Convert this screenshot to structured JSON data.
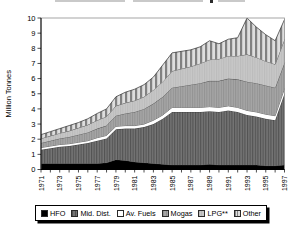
{
  "chart_data": {
    "type": "area",
    "stacked": true,
    "title": "",
    "ylabel": "Million Tonnes",
    "ylim": [
      0,
      10
    ],
    "yticks": [
      0,
      1,
      2,
      3,
      4,
      5,
      6,
      7,
      8,
      9,
      10
    ],
    "x": [
      1971,
      1972,
      1973,
      1974,
      1975,
      1976,
      1977,
      1978,
      1979,
      1980,
      1981,
      1982,
      1983,
      1984,
      1985,
      1986,
      1987,
      1988,
      1989,
      1990,
      1991,
      1992,
      1993,
      1994,
      1995,
      1996,
      1997
    ],
    "xtick_labels": [
      "1971",
      "1973",
      "1975",
      "1977",
      "1979",
      "1981",
      "1983",
      "1985",
      "1987",
      "1989",
      "1991",
      "1993",
      "1995",
      "1997"
    ],
    "grid": false,
    "legend_position": "bottom",
    "series": [
      {
        "name": "HFO",
        "color": "#000000",
        "pattern": "solid",
        "values": [
          0.4,
          0.4,
          0.4,
          0.4,
          0.4,
          0.4,
          0.4,
          0.45,
          0.65,
          0.6,
          0.5,
          0.45,
          0.4,
          0.35,
          0.3,
          0.3,
          0.3,
          0.3,
          0.35,
          0.3,
          0.3,
          0.3,
          0.3,
          0.3,
          0.25,
          0.25,
          0.3
        ]
      },
      {
        "name": "Mid. Dist.",
        "color": "#757575",
        "pattern": "vstripes-dark",
        "values": [
          0.9,
          1.0,
          1.1,
          1.15,
          1.25,
          1.35,
          1.5,
          1.6,
          2.0,
          2.1,
          2.2,
          2.35,
          2.6,
          3.0,
          3.5,
          3.5,
          3.5,
          3.5,
          3.5,
          3.5,
          3.6,
          3.5,
          3.3,
          3.2,
          3.1,
          3.0,
          4.7
        ]
      },
      {
        "name": "Av. Fuels",
        "color": "#ffffff",
        "pattern": "solid",
        "values": [
          0.15,
          0.15,
          0.15,
          0.15,
          0.15,
          0.15,
          0.2,
          0.2,
          0.2,
          0.2,
          0.2,
          0.2,
          0.25,
          0.25,
          0.3,
          0.3,
          0.3,
          0.3,
          0.3,
          0.3,
          0.3,
          0.3,
          0.3,
          0.3,
          0.3,
          0.3,
          0.35
        ]
      },
      {
        "name": "Mogas",
        "color": "#a6a6a6",
        "pattern": "vstripes-fine",
        "values": [
          0.3,
          0.35,
          0.4,
          0.45,
          0.5,
          0.55,
          0.6,
          0.65,
          0.7,
          0.8,
          0.9,
          1.0,
          1.1,
          1.2,
          1.3,
          1.4,
          1.5,
          1.6,
          1.7,
          1.75,
          1.8,
          1.85,
          1.9,
          1.9,
          1.9,
          1.85,
          1.7
        ]
      },
      {
        "name": "LPG**",
        "color": "#c7c7c7",
        "pattern": "vstripes-faint",
        "values": [
          0.3,
          0.32,
          0.35,
          0.4,
          0.45,
          0.5,
          0.55,
          0.6,
          0.65,
          0.7,
          0.75,
          0.8,
          0.9,
          1.0,
          1.1,
          1.15,
          1.2,
          1.3,
          1.4,
          1.45,
          1.5,
          1.55,
          1.8,
          1.7,
          1.6,
          1.55,
          1.55
        ]
      },
      {
        "name": "Other",
        "color": "#dedede",
        "pattern": "vstripes-bold",
        "values": [
          0.25,
          0.28,
          0.3,
          0.35,
          0.35,
          0.4,
          0.45,
          0.5,
          0.6,
          0.7,
          0.75,
          0.8,
          0.85,
          1.1,
          1.2,
          1.15,
          1.1,
          1.1,
          1.25,
          1.0,
          1.1,
          1.2,
          2.4,
          2.0,
          1.75,
          1.55,
          1.3
        ]
      }
    ],
    "colors": {
      "axis": "#000000",
      "frame": "#8f8f8f",
      "boundary_line": "#2f2f2f",
      "legend_shadow": "#000000"
    }
  }
}
